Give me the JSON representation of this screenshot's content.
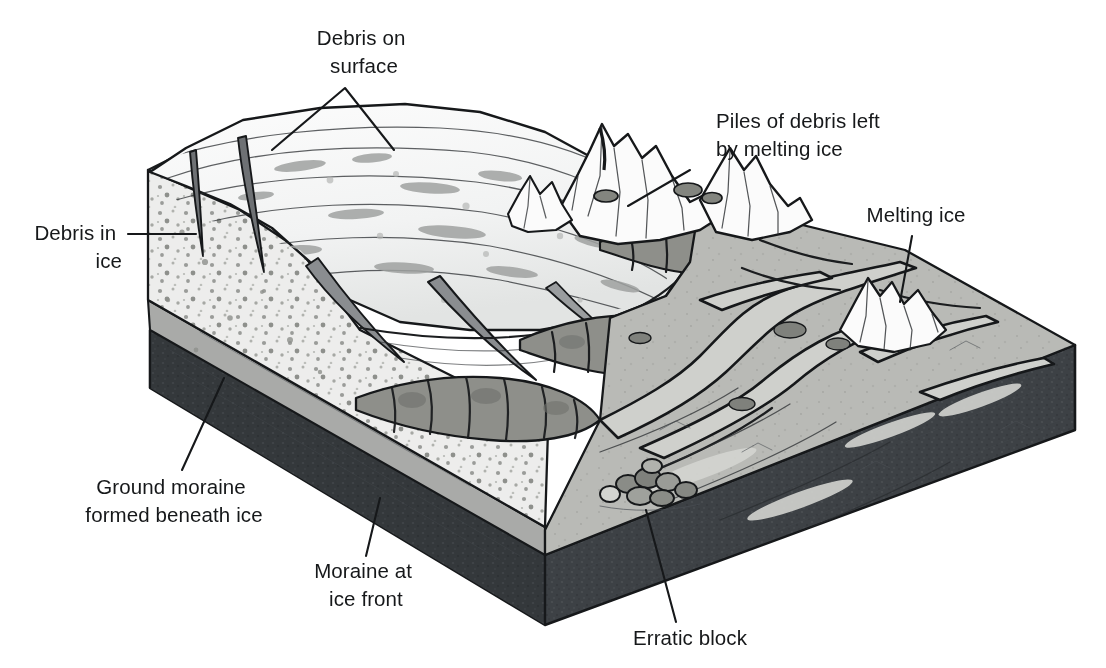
{
  "labels": [
    {
      "id": "debris-on-surface",
      "lines": [
        "Debris on",
        "surface"
      ],
      "anchor": "middle",
      "x": 364,
      "y": 45
    },
    {
      "id": "piles-of-debris",
      "lines": [
        "Piles of debris left",
        "by melting ice"
      ],
      "anchor": "start",
      "x": 716,
      "y": 128
    },
    {
      "id": "debris-in-ice",
      "lines": [
        "Debris in",
        "ice"
      ],
      "anchor": "end",
      "x": 122,
      "y": 240
    },
    {
      "id": "melting-ice",
      "lines": [
        "Melting ice"
      ],
      "anchor": "middle",
      "x": 916,
      "y": 222
    },
    {
      "id": "ground-moraine",
      "lines": [
        "Ground moraine",
        "formed beneath ice"
      ],
      "anchor": "middle",
      "x": 174,
      "y": 494
    },
    {
      "id": "moraine-at-ice-front",
      "lines": [
        "Moraine at",
        "ice front"
      ],
      "anchor": "middle",
      "x": 366,
      "y": 578
    },
    {
      "id": "erratic-block",
      "lines": [
        "Erratic block"
      ],
      "anchor": "middle",
      "x": 690,
      "y": 645
    }
  ],
  "colors": {
    "ink": "#1b1d1f",
    "paper": "#ffffff",
    "ice_surface": "#f7f8f8",
    "ice_shadow": "#dcdede",
    "ice_section": "#ededec",
    "ground_moraine_band": "#a9aaa8",
    "bedrock_dark": "#3d4145",
    "bedrock_front": "#34383b",
    "outwash_plain": "#b9bab6",
    "outwash_light": "#d4d5d1",
    "moraine_ridge": "#8e8f8a",
    "boulder": "#7f817c",
    "channel": "#c9cac6"
  },
  "features": [
    {
      "name": "glacier-ice-mass",
      "note": "white ice tongue at left with crevasses and flow lines"
    },
    {
      "name": "crevasse",
      "note": "dark wedge-shaped cracks in ice surface"
    },
    {
      "name": "debris-bands",
      "note": "gray smudged streaks of rock debris on and in ice"
    },
    {
      "name": "ice-cross-section",
      "note": "speckled cut face showing debris dispersed in ice"
    },
    {
      "name": "ground-moraine-layer",
      "note": "thin gray band beneath the ice in cross-section"
    },
    {
      "name": "bedrock-base",
      "note": "dark textured slab forming base of block"
    },
    {
      "name": "terminal-moraine-ridge",
      "note": "lumpy segmented arc of debris at the ice front"
    },
    {
      "name": "outwash-plain",
      "note": "gray braided plain right of the ice front"
    },
    {
      "name": "meltwater-channels",
      "note": "braided dark-outlined stream channels"
    },
    {
      "name": "stranded-ice-block",
      "note": "white jagged peaks of melting ice remnants"
    },
    {
      "name": "erratic-boulder-cluster",
      "note": "cluster of rounded boulders on the plain"
    }
  ]
}
